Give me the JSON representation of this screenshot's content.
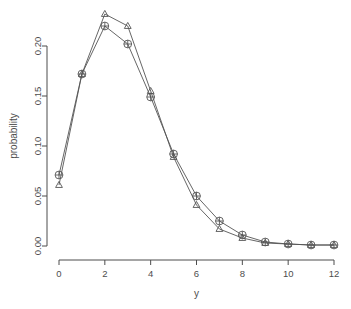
{
  "chart_data": {
    "type": "line",
    "title": "",
    "subtitle": "",
    "xlabel": "y",
    "ylabel": "probability",
    "x": [
      0,
      1,
      2,
      3,
      4,
      5,
      6,
      7,
      8,
      9,
      10,
      11,
      12
    ],
    "series": [
      {
        "name": "circles",
        "marker": "circle-plus",
        "color": "#555555",
        "values": [
          0.071,
          0.172,
          0.22,
          0.202,
          0.149,
          0.092,
          0.05,
          0.025,
          0.011,
          0.004,
          0.002,
          0.001,
          0.001
        ]
      },
      {
        "name": "triangles",
        "marker": "triangle",
        "color": "#555555",
        "values": [
          0.061,
          0.172,
          0.232,
          0.22,
          0.155,
          0.089,
          0.041,
          0.017,
          0.008,
          0.003,
          0.002,
          0.001,
          0.001
        ]
      }
    ],
    "xlim": [
      -0.55,
      12.55
    ],
    "ylim": [
      -0.008,
      0.244
    ],
    "xticks": [
      0,
      2,
      4,
      6,
      8,
      10,
      12
    ],
    "xtick_labels": [
      "0",
      "2",
      "4",
      "6",
      "8",
      "10",
      "12"
    ],
    "yticks": [
      0.0,
      0.05,
      0.1,
      0.15,
      0.2
    ],
    "ytick_labels": [
      "0.00",
      "0.05",
      "0.10",
      "0.15",
      "0.20"
    ],
    "grid": false,
    "legend": null,
    "axis_color": "#4d4d4d",
    "background": "#ffffff"
  }
}
